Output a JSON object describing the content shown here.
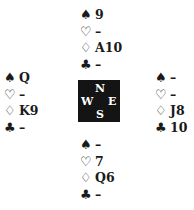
{
  "suits": {
    "spades": "♠",
    "hearts": "♡",
    "diamonds": "♢",
    "clubs": "♣"
  },
  "hands": {
    "north": {
      "spades": "9",
      "hearts": "–",
      "diamonds": "A10",
      "clubs": "–"
    },
    "west": {
      "spades": "Q",
      "hearts": "–",
      "diamonds": "K9",
      "clubs": "–"
    },
    "east": {
      "spades": "–",
      "hearts": "–",
      "diamonds": "J8",
      "clubs": "10"
    },
    "south": {
      "spades": "–",
      "hearts": "7",
      "diamonds": "Q6",
      "clubs": "–"
    }
  },
  "compass": {
    "north": "N",
    "west": "W",
    "east": "E",
    "south": "S"
  }
}
